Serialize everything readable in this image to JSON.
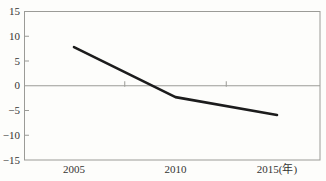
{
  "chart_data": {
    "type": "line",
    "x": [
      2005,
      2010,
      2015
    ],
    "values": [
      7.8,
      -2.3,
      -5.9
    ],
    "title": "",
    "xlabel": "(年)",
    "ylabel": "",
    "ylim": [
      -15,
      15
    ],
    "yticks": [
      15,
      10,
      5,
      0,
      -5,
      -10,
      -15
    ],
    "ytick_labels": [
      "15",
      "10",
      "5",
      "0",
      "−5",
      "−10",
      "−15"
    ],
    "xtick_labels": [
      "2005",
      "2010",
      "2015(年)"
    ],
    "zero_line": true,
    "zero_axis_tick_years": [
      2007.5,
      2012.5
    ],
    "grid": false,
    "legend": "none",
    "colors": {
      "line": "#1c1c1c",
      "axis": "#9b9b97",
      "text": "#343432",
      "background": "#fdfdfb"
    }
  }
}
